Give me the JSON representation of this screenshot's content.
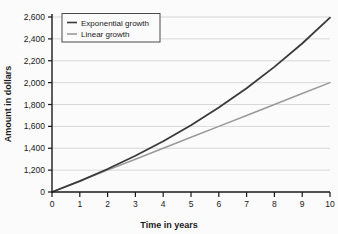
{
  "chart_data": {
    "type": "line",
    "title": "",
    "xlabel": "Time in years",
    "ylabel": "Amount in dollars",
    "x": [
      0,
      1,
      2,
      3,
      4,
      5,
      6,
      7,
      8,
      9,
      10
    ],
    "xlim": [
      0,
      10
    ],
    "ylim": [
      1000,
      2600
    ],
    "y_axis_break": true,
    "y_break_from": 0,
    "y_break_to": 1200,
    "grid": "horizontal",
    "legend_position": "top-left",
    "xticks": [
      "0",
      "1",
      "2",
      "3",
      "4",
      "5",
      "6",
      "7",
      "8",
      "9",
      "10"
    ],
    "yticks": [
      "0",
      "1,200",
      "1,400",
      "1,600",
      "1,800",
      "2,000",
      "2,200",
      "2,400",
      "2,600"
    ],
    "ytick_values": [
      1000,
      1200,
      1400,
      1600,
      1800,
      2000,
      2200,
      2400,
      2600
    ],
    "series": [
      {
        "name": "Exponential growth",
        "color": "#3a3a3a",
        "values": [
          1000,
          1100,
          1210,
          1331,
          1464,
          1611,
          1772,
          1949,
          2144,
          2358,
          2594
        ]
      },
      {
        "name": "Linear growth",
        "color": "#9a9a9a",
        "values": [
          1000,
          1100,
          1200,
          1300,
          1400,
          1500,
          1600,
          1700,
          1800,
          1900,
          2000
        ]
      }
    ]
  },
  "legend": {
    "items": [
      {
        "label": "Exponential growth"
      },
      {
        "label": "Linear growth"
      }
    ]
  },
  "colors": {
    "exponential": "#3a3a3a",
    "linear": "#9a9a9a",
    "axis": "#1a1a1a",
    "grid": "#c9c9c9",
    "background": "#fbfbfb"
  }
}
